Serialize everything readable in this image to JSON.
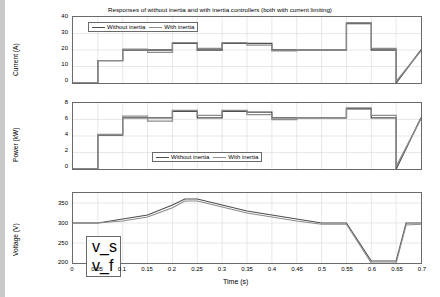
{
  "figure": {
    "title": "Responses of without inertia and with inertia controllers (both with current limiting)",
    "xlabel": "Time (s)",
    "xticks": [
      "0",
      "0.05",
      "0.1",
      "0.15",
      "0.2",
      "0.25",
      "0.3",
      "0.35",
      "0.4",
      "0.45",
      "0.5",
      "0.55",
      "0.6",
      "0.65",
      "0.7"
    ],
    "xlim": [
      0,
      0.7
    ],
    "colors": {
      "without_inertia": "#4d4d4d",
      "with_inertia": "#8c8c8c",
      "axis": "#6a6a6a",
      "grid": "#d9d9d9",
      "sidebar": "#c9c9c9"
    }
  },
  "chart_data": [
    {
      "type": "line",
      "title": "Current response",
      "xlabel": "Time (s)",
      "ylabel": "Current (A)",
      "xlim": [
        0,
        0.7
      ],
      "ylim": [
        0,
        40
      ],
      "yticks": [
        "0",
        "10",
        "20",
        "30",
        "40"
      ],
      "grid": true,
      "legend_position": "top-left",
      "legend": [
        "Without inertia",
        "With inertia"
      ],
      "series": [
        {
          "name": "Without inertia",
          "x": [
            0,
            0.05,
            0.05,
            0.1,
            0.1,
            0.15,
            0.15,
            0.2,
            0.2,
            0.25,
            0.25,
            0.3,
            0.3,
            0.35,
            0.35,
            0.4,
            0.4,
            0.45,
            0.45,
            0.5,
            0.5,
            0.55,
            0.55,
            0.6,
            0.6,
            0.65,
            0.65,
            0.7
          ],
          "y": [
            0,
            0,
            13.5,
            13.5,
            20,
            20,
            20,
            20,
            24,
            24,
            20,
            20,
            24,
            24,
            24,
            24,
            20,
            20,
            20,
            20,
            20,
            20,
            36,
            36,
            20,
            20,
            0,
            20
          ]
        },
        {
          "name": "With inertia",
          "x": [
            0,
            0.05,
            0.05,
            0.1,
            0.1,
            0.15,
            0.15,
            0.2,
            0.2,
            0.25,
            0.25,
            0.3,
            0.3,
            0.35,
            0.35,
            0.4,
            0.4,
            0.45,
            0.45,
            0.5,
            0.5,
            0.55,
            0.55,
            0.6,
            0.6,
            0.65,
            0.65,
            0.7
          ],
          "y": [
            0,
            0,
            13.5,
            13.5,
            20.5,
            20.5,
            18.5,
            18.5,
            24.5,
            24.5,
            21,
            21,
            24.5,
            24.5,
            23,
            23,
            19.5,
            19.5,
            20,
            20,
            20,
            20,
            36.5,
            36.5,
            21,
            21,
            1,
            19.5
          ]
        }
      ]
    },
    {
      "type": "line",
      "title": "Power response",
      "xlabel": "Time (s)",
      "ylabel": "Power (kW)",
      "xlim": [
        0,
        0.7
      ],
      "ylim": [
        0,
        8
      ],
      "yticks": [
        "0",
        "2",
        "4",
        "6",
        "8"
      ],
      "grid": true,
      "legend_position": "bottom-center",
      "legend": [
        "Without inertia",
        "With inertia"
      ],
      "series": [
        {
          "name": "Without inertia",
          "x": [
            0,
            0.05,
            0.05,
            0.1,
            0.1,
            0.15,
            0.15,
            0.2,
            0.2,
            0.25,
            0.25,
            0.3,
            0.3,
            0.35,
            0.35,
            0.4,
            0.4,
            0.45,
            0.45,
            0.5,
            0.5,
            0.55,
            0.55,
            0.6,
            0.6,
            0.65,
            0.65,
            0.7
          ],
          "y": [
            0,
            0,
            4.1,
            4.1,
            6.2,
            6.2,
            6.2,
            6.2,
            7.0,
            7.0,
            6.2,
            6.2,
            7.0,
            7.0,
            6.9,
            6.9,
            6.2,
            6.2,
            6.2,
            6.2,
            6.2,
            6.2,
            7.3,
            7.3,
            6.2,
            6.2,
            0,
            6.2
          ]
        },
        {
          "name": "With inertia",
          "x": [
            0,
            0.05,
            0.05,
            0.1,
            0.1,
            0.15,
            0.15,
            0.2,
            0.2,
            0.25,
            0.25,
            0.3,
            0.3,
            0.35,
            0.35,
            0.4,
            0.4,
            0.45,
            0.45,
            0.5,
            0.5,
            0.55,
            0.55,
            0.6,
            0.6,
            0.65,
            0.65,
            0.7
          ],
          "y": [
            0,
            0,
            4.2,
            4.2,
            6.4,
            6.4,
            5.8,
            5.8,
            7.1,
            7.1,
            6.5,
            6.5,
            7.1,
            7.1,
            6.6,
            6.6,
            6.0,
            6.0,
            6.2,
            6.2,
            6.2,
            6.2,
            7.4,
            7.4,
            6.5,
            6.5,
            0.3,
            6.1
          ]
        }
      ]
    },
    {
      "type": "line",
      "title": "Voltage response",
      "xlabel": "Time (s)",
      "ylabel": "Voltage (V)",
      "xlim": [
        0,
        0.7
      ],
      "ylim": [
        200,
        375
      ],
      "yticks": [
        "200",
        "250",
        "300",
        "350"
      ],
      "grid": true,
      "legend_position": "bottom-left",
      "legend": [
        "v_s",
        "v_f"
      ],
      "series": [
        {
          "name": "v_s",
          "x": [
            0,
            0.05,
            0.1,
            0.15,
            0.2,
            0.225,
            0.25,
            0.3,
            0.35,
            0.4,
            0.45,
            0.5,
            0.55,
            0.6,
            0.62,
            0.65,
            0.67,
            0.7
          ],
          "y": [
            300,
            300,
            310,
            320,
            345,
            360,
            360,
            345,
            330,
            320,
            310,
            300,
            300,
            205,
            205,
            205,
            300,
            300
          ]
        },
        {
          "name": "v_f",
          "x": [
            0,
            0.05,
            0.1,
            0.15,
            0.2,
            0.225,
            0.25,
            0.3,
            0.35,
            0.4,
            0.45,
            0.5,
            0.55,
            0.6,
            0.62,
            0.65,
            0.67,
            0.7
          ],
          "y": [
            300,
            300,
            305,
            315,
            338,
            355,
            355,
            340,
            325,
            315,
            305,
            297,
            297,
            200,
            200,
            200,
            295,
            297
          ]
        }
      ]
    }
  ]
}
